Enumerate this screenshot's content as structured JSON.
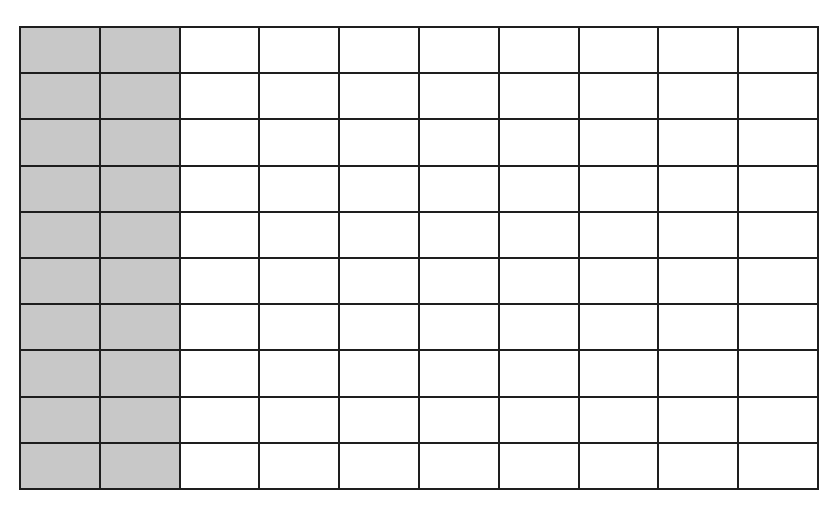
{
  "diagram": {
    "type": "hundred-grid",
    "rows": 10,
    "columns": 10,
    "total_cells": 100,
    "shaded_columns": 2,
    "shaded_cells": 20,
    "colors": {
      "shaded": "#c8c8c8",
      "unshaded": "#ffffff",
      "gridline": "#1e1e1e"
    }
  }
}
